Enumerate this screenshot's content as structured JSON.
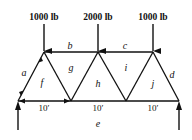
{
  "diagram": {
    "type": "truss",
    "colors": {
      "line": "#111111",
      "background": "#ffffff"
    },
    "loads": [
      {
        "label": "1000 lb",
        "node": "top-left"
      },
      {
        "label": "2000 lb",
        "node": "top-middle"
      },
      {
        "label": "1000 lb",
        "node": "top-right"
      }
    ],
    "regions": {
      "a": "a",
      "b": "b",
      "c": "c",
      "d": "d",
      "e": "e",
      "f": "f",
      "g": "g",
      "h": "h",
      "i": "i",
      "j": "j"
    },
    "dimensions": [
      {
        "label": "10′"
      },
      {
        "label": "10′"
      },
      {
        "label": "10′"
      }
    ],
    "supports": [
      {
        "type": "reaction-arrow-up",
        "node": "bottom-left"
      },
      {
        "type": "reaction-arrow-up",
        "node": "bottom-right"
      }
    ]
  }
}
